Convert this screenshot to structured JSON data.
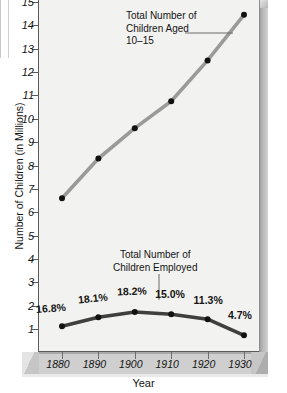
{
  "chart_data": {
    "type": "line",
    "title": "",
    "xlabel": "Year",
    "ylabel": "Number of Children (in Millions)",
    "x": [
      1880,
      1890,
      1900,
      1910,
      1920,
      1930
    ],
    "xtick_labels": [
      "1880",
      "1890",
      "1900",
      "1910",
      "1920",
      "1930"
    ],
    "ylim": [
      0,
      15
    ],
    "ytick_labels": [
      "15",
      "14",
      "13",
      "12",
      "11",
      "10",
      "9",
      "8",
      "7",
      "6",
      "5",
      "4",
      "3",
      "2",
      "1"
    ],
    "ytick_values": [
      15,
      14,
      13,
      12,
      11,
      10,
      9,
      8,
      7,
      6,
      5,
      4,
      3,
      2,
      1
    ],
    "grid": false,
    "legend_position": "inline-annotation",
    "series": [
      {
        "name": "Total Number of Children Aged 10–15",
        "values": [
          6.6,
          8.3,
          9.6,
          10.75,
          12.5,
          14.45
        ],
        "color": "#9a9a9a",
        "marker_color": "#111111"
      },
      {
        "name": "Total Number of Children Employed",
        "values": [
          1.12,
          1.5,
          1.73,
          1.63,
          1.42,
          0.73
        ],
        "color": "#3f3f3f",
        "marker_color": "#111111",
        "point_labels": [
          "16.8%",
          "18.1%",
          "18.2%",
          "15.0%",
          "11.3%",
          "4.7%"
        ]
      }
    ],
    "annotations": [
      {
        "name": "upper-series-annotation",
        "lines": [
          "Total Number of",
          "Children Aged",
          "10–15"
        ]
      },
      {
        "name": "lower-series-annotation",
        "lines": [
          "Total Number of",
          "Children Employed"
        ]
      }
    ]
  },
  "yaxis": {
    "title": "Number of Children (in Millions)",
    "labels": [
      "15",
      "14",
      "13",
      "12",
      "11",
      "10",
      "9",
      "8",
      "7",
      "6",
      "5",
      "4",
      "3",
      "2",
      "1"
    ]
  },
  "xaxis": {
    "title": "Year",
    "labels": [
      "1880",
      "1890",
      "1900",
      "1910",
      "1920",
      "1930"
    ]
  },
  "annotation_top": {
    "line1": "Total Number of",
    "line2": "Children Aged",
    "line3": "10–15"
  },
  "annotation_bottom": {
    "line1": "Total Number of",
    "line2": "Children Employed"
  },
  "percent_labels": [
    "16.8%",
    "18.1%",
    "18.2%",
    "15.0%",
    "11.3%",
    "4.7%"
  ],
  "colors": {
    "plot_background": "#f2f2f0",
    "upper_line": "#9a9a9a",
    "lower_line": "#3f3f3f",
    "marker": "#111111",
    "axis": "#5a5a5a",
    "base_slab": "#cfcfcf"
  }
}
